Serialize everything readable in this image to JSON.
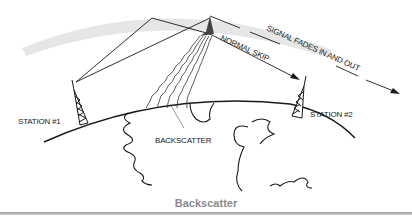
{
  "figure": {
    "caption": "Backscatter",
    "labels": {
      "station1": "STATION #1",
      "station2": "STATION #2",
      "backscatter": "BACKSCATTER",
      "normal_skip": "NORMAL SKIP",
      "signal_fades": "SIGNAL FADES IN AND OUT"
    },
    "colors": {
      "ionosphere": "#e6e6e6",
      "lines": "#1a1a1a",
      "caption": "#8a8a8a"
    }
  }
}
